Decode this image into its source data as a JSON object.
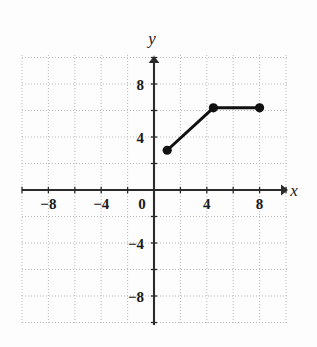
{
  "chart_data": {
    "type": "line",
    "title": "",
    "xlabel": "x",
    "ylabel": "y",
    "xlim": [
      -10,
      10
    ],
    "ylim": [
      -10,
      10
    ],
    "grid": true,
    "grid_step": 2,
    "legend": "none",
    "x_tick_labels": [
      "−8",
      "−4",
      "0",
      "4",
      "8"
    ],
    "x_tick_values": [
      -8,
      -4,
      0,
      4,
      8
    ],
    "y_tick_labels": [
      "8",
      "4",
      "0",
      "−4",
      "−8"
    ],
    "y_tick_values": [
      8,
      4,
      0,
      -4,
      -8
    ],
    "series": [
      {
        "name": "piecewise-segment",
        "marker": "filled-circle",
        "x": [
          1,
          4.5,
          8
        ],
        "y": [
          3,
          6.2,
          6.2
        ]
      }
    ],
    "points": [
      {
        "label": "left-endpoint",
        "x": 1,
        "y": 3
      },
      {
        "label": "vertex",
        "x": 4.5,
        "y": 6.2
      },
      {
        "label": "right-endpoint",
        "x": 8,
        "y": 6.2
      }
    ],
    "colors": {
      "grid": "#b9b9b9",
      "axis": "#2b2b2b",
      "line": "#111111",
      "marker": "#111111",
      "background": "#fdfdfd"
    }
  },
  "axis_labels": {
    "x": "x",
    "y": "y"
  },
  "x_ticks": [
    {
      "label": "−8",
      "value": -8
    },
    {
      "label": "−4",
      "value": -4
    },
    {
      "label": "0",
      "value": 0
    },
    {
      "label": "4",
      "value": 4
    },
    {
      "label": "8",
      "value": 8
    }
  ],
  "y_ticks": [
    {
      "label": "8",
      "value": 8
    },
    {
      "label": "4",
      "value": 4
    },
    {
      "label": "0",
      "value": 0
    },
    {
      "label": "−4",
      "value": -4
    },
    {
      "label": "−8",
      "value": -8
    }
  ]
}
